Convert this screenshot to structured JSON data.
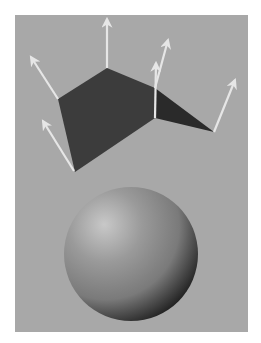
{
  "figure": {
    "colors": {
      "page_background": "#ffffff",
      "panel_background": "#a8a8a8",
      "polygon_fill": "#3c3c3c",
      "polygon_fill_dark": "#2a2a2a",
      "arrow_color": "#e6e6e6",
      "sphere_highlight": "#c8c8c8",
      "sphere_mid": "#7a7a7a",
      "sphere_shadow": "#1e1e1e"
    },
    "elements": {
      "polygon_surface": "polygonal-surface",
      "normal_arrow_count": 6,
      "sphere": "shaded-sphere"
    }
  }
}
